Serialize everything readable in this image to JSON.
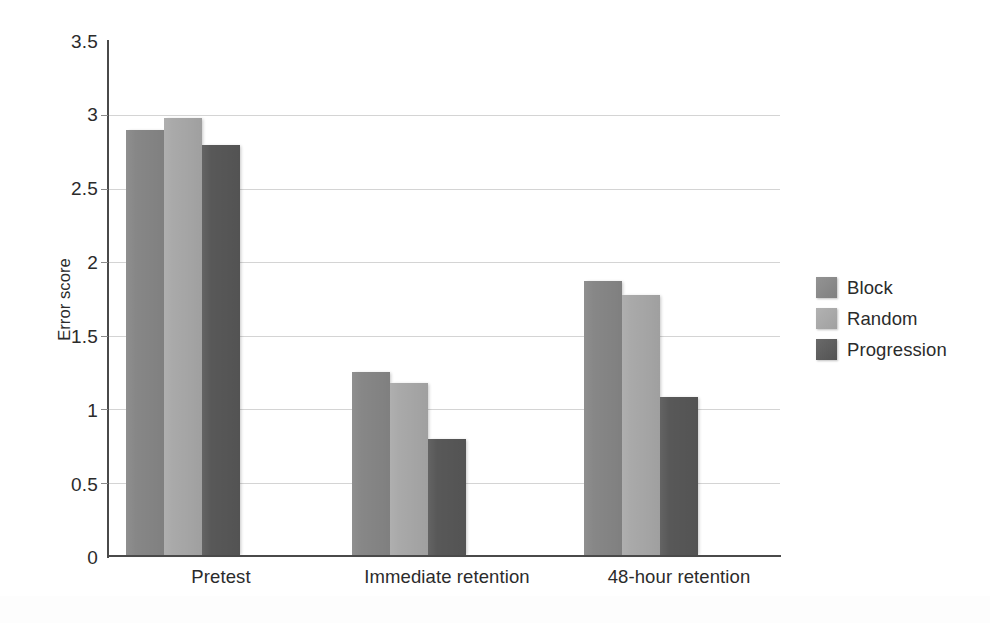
{
  "chart_data": {
    "type": "bar",
    "title": "",
    "subtitle": "",
    "xlabel": "",
    "ylabel": "Error score",
    "categories": [
      "Pretest",
      "Immediate retention",
      "48-hour retention"
    ],
    "series": [
      {
        "name": "Block",
        "values": [
          2.9,
          1.25,
          1.87
        ],
        "color": "#878787"
      },
      {
        "name": "Random",
        "values": [
          2.98,
          1.18,
          1.78
        ],
        "color": "#a9a9a9"
      },
      {
        "name": "Progression",
        "values": [
          2.8,
          0.8,
          1.08
        ],
        "color": "#585858"
      }
    ],
    "ylim": [
      0,
      3.5
    ],
    "y_ticks": [
      "0",
      "0.5",
      "1",
      "1.5",
      "2",
      "2.5",
      "3",
      "3.5"
    ],
    "y_tick_values": [
      0,
      0.5,
      1,
      1.5,
      2,
      2.5,
      3,
      3.5
    ],
    "grid": true,
    "grid_axis": "y",
    "legend_position": "right",
    "legend": [
      "Block",
      "Random",
      "Progression"
    ],
    "annotations": []
  },
  "axes": {
    "y_title": "Error score",
    "axis_color": "#4a4a4a",
    "grid_color": "#d4d4d4"
  }
}
